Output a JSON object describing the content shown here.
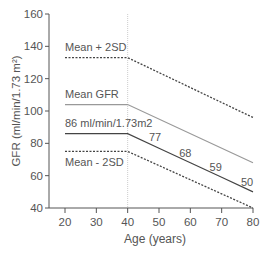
{
  "chart_data": {
    "type": "line",
    "title": "",
    "xlabel": "Age (years)",
    "ylabel": "GFR (ml/min/1.73 m²)",
    "xlim": [
      15,
      80
    ],
    "ylim": [
      40,
      160
    ],
    "x_ticks": [
      20,
      30,
      40,
      50,
      60,
      70,
      80
    ],
    "y_ticks": [
      40,
      60,
      80,
      100,
      120,
      140,
      160
    ],
    "grid": false,
    "reference_line": {
      "x": 40,
      "style": "dotted"
    },
    "series": [
      {
        "name": "Mean + 2SD",
        "style": "dashed",
        "color": "#444444",
        "x": [
          20,
          40,
          80
        ],
        "values": [
          133,
          133,
          96
        ]
      },
      {
        "name": "Mean GFR",
        "style": "solid",
        "color": "#999999",
        "x": [
          20,
          40,
          80
        ],
        "values": [
          104,
          104,
          68
        ]
      },
      {
        "name": "86 ml/min/1.73m2",
        "style": "solid",
        "color": "#444444",
        "x": [
          20,
          40,
          50,
          60,
          70,
          80
        ],
        "values": [
          86,
          86,
          77,
          68,
          59,
          50
        ]
      },
      {
        "name": "Mean - 2SD",
        "style": "dashed",
        "color": "#444444",
        "x": [
          20,
          40,
          80
        ],
        "values": [
          75,
          75,
          40
        ]
      }
    ],
    "annotations": [
      {
        "text": "Mean + 2SD",
        "x": 20,
        "y": 133
      },
      {
        "text": "Mean GFR",
        "x": 20,
        "y": 104
      },
      {
        "text": "86 ml/min/1.73m2",
        "x": 20,
        "y": 86
      },
      {
        "text": "Mean - 2SD",
        "x": 20,
        "y": 75
      },
      {
        "text": "77",
        "x": 50,
        "y": 77
      },
      {
        "text": "68",
        "x": 60,
        "y": 68
      },
      {
        "text": "59",
        "x": 70,
        "y": 59
      },
      {
        "text": "50",
        "x": 80,
        "y": 50
      }
    ]
  }
}
